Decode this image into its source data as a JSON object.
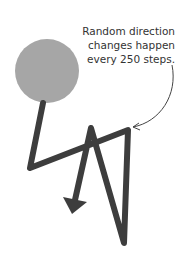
{
  "annotation": {
    "lines": [
      "Random direction",
      "changes happen",
      "every 250 steps."
    ]
  },
  "colors": {
    "circle": "#a6a6a6",
    "path": "#3d3d3d",
    "arrow_line": "#444444",
    "text": "#333333"
  },
  "diagram": {
    "circle": {
      "cx": 47,
      "cy": 71,
      "r": 32
    },
    "path_points": [
      [
        43,
        103
      ],
      [
        30,
        168
      ],
      [
        128,
        130
      ],
      [
        124,
        243
      ],
      [
        91,
        128
      ],
      [
        73,
        211
      ]
    ]
  }
}
